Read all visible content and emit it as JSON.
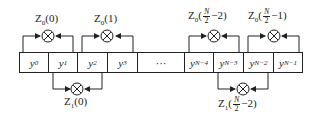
{
  "diagram": {
    "cells": [
      {
        "base": "y",
        "sub": "0",
        "x": 19,
        "w": 30
      },
      {
        "base": "y",
        "sub": "1",
        "x": 48,
        "w": 30
      },
      {
        "base": "y",
        "sub": "2",
        "x": 77,
        "w": 31
      },
      {
        "base": "y",
        "sub": "3",
        "x": 107,
        "w": 31
      },
      {
        "base": "···",
        "sub": "",
        "x": 137,
        "w": 48
      },
      {
        "base": "y",
        "sub": "N−4",
        "x": 184,
        "w": 30
      },
      {
        "base": "y",
        "sub": "N−3",
        "x": 213,
        "w": 31
      },
      {
        "base": "y",
        "sub": "N−2",
        "x": 243,
        "w": 31
      },
      {
        "base": "y",
        "sub": "N−1",
        "x": 273,
        "w": 30
      }
    ],
    "labels": {
      "z0_0": {
        "pre": "Z",
        "sub": "0",
        "arg": "(0)"
      },
      "z0_1": {
        "pre": "Z",
        "sub": "0",
        "arg": "(1)"
      },
      "z1_0": {
        "pre": "Z",
        "sub": "1",
        "arg": "(0)"
      },
      "z0_n2": {
        "pre": "Z",
        "sub": "0",
        "num": "N",
        "den": "2",
        "tail": "−2)"
      },
      "z0_n1": {
        "pre": "Z",
        "sub": "0",
        "num": "N",
        "den": "2",
        "tail": "−1)"
      },
      "z1_n2": {
        "pre": "Z",
        "sub": "1",
        "num": "N",
        "den": "2",
        "tail": "−2)"
      }
    },
    "multiplier_symbol": "⊗"
  }
}
